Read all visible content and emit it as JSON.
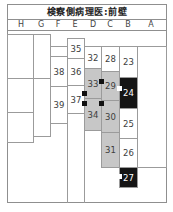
{
  "title": "検察側病理医:前壁",
  "columns": [
    "H",
    "G",
    "F",
    "E",
    "D",
    "C",
    "B",
    "A"
  ],
  "cells": {
    "h1": {
      "label": "",
      "state": "empty"
    },
    "h2": {
      "label": "",
      "state": "empty"
    },
    "h3": {
      "label": "",
      "state": "empty"
    },
    "g1": {
      "label": "",
      "state": "empty"
    },
    "g2": {
      "label": "",
      "state": "empty"
    },
    "f0": {
      "label": "",
      "state": "empty"
    },
    "c38": {
      "label": "38",
      "state": "normal"
    },
    "c39": {
      "label": "39",
      "state": "normal"
    },
    "c35": {
      "label": "35",
      "state": "normal"
    },
    "c36": {
      "label": "36",
      "state": "normal"
    },
    "c37": {
      "label": "37",
      "state": "normal"
    },
    "c32": {
      "label": "32",
      "state": "normal"
    },
    "c33": {
      "label": "33",
      "state": "shaded"
    },
    "c34": {
      "label": "34",
      "state": "shaded"
    },
    "c28": {
      "label": "28",
      "state": "normal"
    },
    "c29": {
      "label": "29",
      "state": "shaded"
    },
    "c30": {
      "label": "30",
      "state": "shaded"
    },
    "c31": {
      "label": "31",
      "state": "shaded"
    },
    "c23": {
      "label": "23",
      "state": "normal"
    },
    "c24": {
      "label": "24",
      "state": "infarct"
    },
    "c25": {
      "label": "25",
      "state": "normal"
    },
    "c26": {
      "label": "26",
      "state": "normal"
    },
    "c27": {
      "label": "27",
      "state": "infarct"
    },
    "a1": {
      "label": "",
      "state": "empty"
    }
  },
  "markers": [
    {
      "color": "black",
      "at": "cell-33-left-bottom"
    },
    {
      "color": "black",
      "at": "cell-34-left-top"
    },
    {
      "color": "black",
      "at": "cell-29-left"
    },
    {
      "color": "black",
      "at": "cell-30-left"
    },
    {
      "color": "white",
      "at": "cell-24-left"
    },
    {
      "color": "white",
      "at": "cell-27-left"
    }
  ],
  "colors": {
    "shaded_cell": "#c7c7c7",
    "infarct_cell": "#151515",
    "grid_line": "#9b9b9b",
    "text": "#3d3d3d"
  }
}
